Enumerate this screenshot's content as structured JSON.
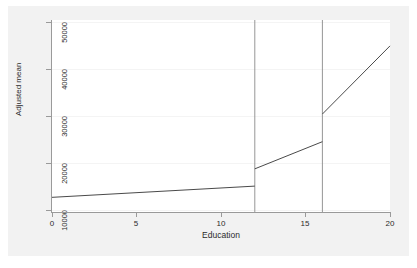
{
  "chart_data": {
    "type": "line",
    "title": "",
    "xlabel": "Education",
    "ylabel": "Adjusted mean",
    "xlim": [
      0,
      20
    ],
    "ylim": [
      7000,
      51500
    ],
    "xticks": [
      0,
      5,
      10,
      15,
      20
    ],
    "xtick_labels": [
      "0",
      "5",
      "10",
      "15",
      "20"
    ],
    "yticks": [
      10000,
      20000,
      30000,
      40000,
      50000
    ],
    "ytick_labels": [
      "10000",
      "20000",
      "30000",
      "40000",
      "50000"
    ],
    "grid": "horizontal",
    "legend": "none",
    "knots": [
      12,
      16
    ],
    "series": [
      {
        "name": "segment-1",
        "x": [
          0,
          12
        ],
        "y": [
          10400,
          13000
        ]
      },
      {
        "name": "segment-2",
        "x": [
          12,
          16
        ],
        "y": [
          17000,
          23300
        ]
      },
      {
        "name": "segment-3",
        "x": [
          16,
          20
        ],
        "y": [
          29700,
          45500
        ]
      }
    ],
    "jumps": [
      {
        "x": 12,
        "y_from": 13000,
        "y_to": 17000
      },
      {
        "x": 16,
        "y_from": 23300,
        "y_to": 29700
      }
    ],
    "vertical_reference_lines": [
      {
        "x": 12,
        "y_bottom": 7000,
        "y_top": 51500
      },
      {
        "x": 16,
        "y_bottom": 7000,
        "y_top": 51500
      }
    ]
  },
  "colors": {
    "graph_background": "#f2f2f2",
    "plot_background": "#ffffff",
    "axis": "#9a9a9a",
    "gridline": "#f4f4f4",
    "line": "#4a4a4a",
    "reference_line": "#8a8a8a",
    "text": "#2b2b2b"
  }
}
